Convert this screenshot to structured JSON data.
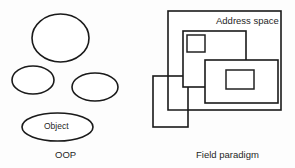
{
  "figure": {
    "background_color": "#fdfdfd",
    "stroke_color": "#1a1a1a",
    "text_color": "#262626",
    "width": 295,
    "height": 168
  },
  "left_panel": {
    "caption": "OOP",
    "object_label": "Object",
    "shape_type": "ellipse",
    "shape_count": 4,
    "shapes": [
      {
        "name": "ellipse-top",
        "cx": 60.5,
        "cy": 38,
        "rx": 28.5,
        "ry": 24,
        "label": ""
      },
      {
        "name": "ellipse-middle-left",
        "cx": 33,
        "cy": 80,
        "rx": 21,
        "ry": 14,
        "label": ""
      },
      {
        "name": "ellipse-middle-right",
        "cx": 95,
        "cy": 87,
        "rx": 23,
        "ry": 14,
        "label": ""
      },
      {
        "name": "ellipse-object",
        "cx": 57.5,
        "cy": 127,
        "rx": 35.5,
        "ry": 14,
        "label": "Object"
      }
    ]
  },
  "right_panel": {
    "caption": "Field paradigm",
    "address_space_label": "Address space",
    "shape_type": "rectangle",
    "shape_count": 5,
    "shapes": [
      {
        "name": "rect-address-space",
        "x": 168,
        "y": 11,
        "width": 113,
        "height": 99,
        "label": "Address space"
      },
      {
        "name": "rect-field-outer-1",
        "x": 183,
        "y": 31,
        "width": 63,
        "height": 56,
        "label": ""
      },
      {
        "name": "rect-field-inner-1",
        "x": 187,
        "y": 35,
        "width": 18,
        "height": 17,
        "label": ""
      },
      {
        "name": "rect-field-outer-2",
        "x": 205,
        "y": 60,
        "width": 73,
        "height": 43,
        "label": ""
      },
      {
        "name": "rect-field-inner-2",
        "x": 226,
        "y": 70,
        "width": 28,
        "height": 19,
        "label": ""
      },
      {
        "name": "rect-field-overflow",
        "x": 153,
        "y": 76,
        "width": 35,
        "height": 51,
        "label": ""
      }
    ]
  }
}
